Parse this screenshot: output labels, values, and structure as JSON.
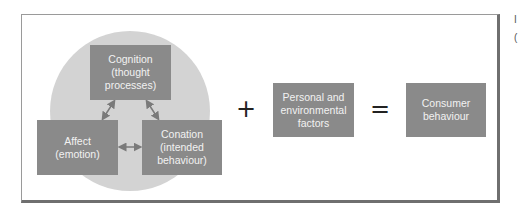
{
  "diagram": {
    "attitude_components": {
      "cognition": {
        "line1": "Cognition",
        "line2": "(thought",
        "line3": "processes)"
      },
      "affect": {
        "line1": "Affect",
        "line2": "(emotion)"
      },
      "conation": {
        "line1": "Conation",
        "line2": "(intended",
        "line3": "behaviour)"
      }
    },
    "operators": {
      "plus": "+",
      "equals": "="
    },
    "factors": {
      "line1": "Personal and",
      "line2": "environmental",
      "line3": "factors"
    },
    "result": {
      "line1": "Consumer",
      "line2": "behaviour"
    },
    "edge_clipped_text": {
      "line1": "I",
      "line2": "("
    }
  },
  "colors": {
    "box_fill": "#8a8a8a",
    "box_text": "#f2f2f2",
    "circle_fill": "#d3d3d3",
    "frame_border": "#6f6f6f",
    "arrow": "#7a7a7a"
  }
}
